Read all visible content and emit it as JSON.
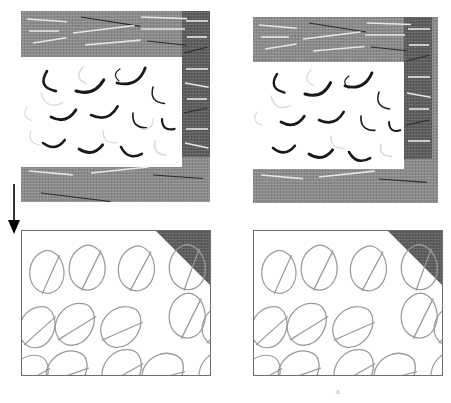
{
  "figure": {
    "title": "",
    "background_color": "#ffffff",
    "width": 451,
    "height": 403,
    "caption": "a"
  },
  "colors": {
    "matrix_light_gray": "#8c8c8c",
    "matrix_dark_gray": "#5e5e5e",
    "core_white": "#ffffff",
    "fiber_dark": "#1a1a1a",
    "fiber_light": "#d9d9d9",
    "leaf_stroke": "#9a9a9a",
    "frame_stroke": "#6e6e6e",
    "arrow_color": "#000000"
  },
  "panels": [
    {
      "id": "top-left",
      "name": "top-left-microstructure",
      "x": 21,
      "y": 11,
      "w": 189,
      "h": 191,
      "core": {
        "x": 0,
        "y": 46,
        "w": 161,
        "h": 110
      },
      "dark_strip": {
        "x": 161,
        "y": 0,
        "w": 28,
        "h": 146
      },
      "label": ""
    },
    {
      "id": "top-right",
      "name": "top-right-microstructure",
      "x": 253,
      "y": 17,
      "w": 185,
      "h": 186,
      "core": {
        "x": 0,
        "y": 45,
        "w": 151,
        "h": 107
      },
      "dark_strip": {
        "x": 151,
        "y": 0,
        "w": 28,
        "h": 142
      },
      "label": ""
    },
    {
      "id": "bottom-left",
      "name": "bottom-left-leaf-pattern",
      "x": 21,
      "y": 230,
      "w": 190,
      "h": 146,
      "corner_triangle": {
        "size": 52
      },
      "label": ""
    },
    {
      "id": "bottom-right",
      "name": "bottom-right-leaf-pattern",
      "x": 253,
      "y": 230,
      "w": 190,
      "h": 146,
      "corner_triangle": {
        "size": 52
      },
      "label": ""
    }
  ],
  "arrow": {
    "name": "transition-arrow-down",
    "x": 5,
    "y": 186,
    "length": 44,
    "direction": "down"
  },
  "chart_data": {
    "type": "scatter",
    "title": "",
    "xlabel": "",
    "ylabel": "",
    "series": [
      {
        "name": "fibers-top-left",
        "count": 19,
        "values": [
          {
            "x": 26,
            "y": 14,
            "len": 22,
            "rot": 66,
            "bow": 16,
            "w": 2.6,
            "tone": "dark"
          },
          {
            "x": 62,
            "y": 10,
            "len": 17,
            "rot": 78,
            "bow": 12,
            "w": 1.4,
            "tone": "light"
          },
          {
            "x": 99,
            "y": 12,
            "len": 12,
            "rot": 95,
            "bow": 8,
            "w": 1.2,
            "tone": "dark"
          },
          {
            "x": 20,
            "y": 36,
            "len": 24,
            "rot": 24,
            "bow": 14,
            "w": 1.3,
            "tone": "light"
          },
          {
            "x": 55,
            "y": 34,
            "len": 30,
            "rot": -22,
            "bow": 12,
            "w": 3.0,
            "tone": "dark"
          },
          {
            "x": 96,
            "y": 26,
            "len": 32,
            "rot": -28,
            "bow": 14,
            "w": 2.8,
            "tone": "dark"
          },
          {
            "x": 132,
            "y": 30,
            "len": 20,
            "rot": 55,
            "bow": 12,
            "w": 1.5,
            "tone": "dark"
          },
          {
            "x": 6,
            "y": 50,
            "len": 14,
            "rot": 72,
            "bow": 9,
            "w": 1.2,
            "tone": "light"
          },
          {
            "x": 30,
            "y": 60,
            "len": 26,
            "rot": -16,
            "bow": 12,
            "w": 2.8,
            "tone": "dark"
          },
          {
            "x": 70,
            "y": 58,
            "len": 28,
            "rot": -18,
            "bow": 13,
            "w": 2.6,
            "tone": "dark"
          },
          {
            "x": 112,
            "y": 56,
            "len": 20,
            "rot": 48,
            "bow": 11,
            "w": 1.6,
            "tone": "dark"
          },
          {
            "x": 141,
            "y": 62,
            "len": 16,
            "rot": 38,
            "bow": 10,
            "w": 2.2,
            "tone": "dark"
          },
          {
            "x": 22,
            "y": 86,
            "len": 22,
            "rot": -8,
            "bow": 11,
            "w": 2.6,
            "tone": "dark"
          },
          {
            "x": 58,
            "y": 92,
            "len": 24,
            "rot": -10,
            "bow": 11,
            "w": 2.8,
            "tone": "dark"
          },
          {
            "x": 100,
            "y": 90,
            "len": 22,
            "rot": 18,
            "bow": 11,
            "w": 2.6,
            "tone": "dark"
          },
          {
            "x": 134,
            "y": 84,
            "len": 18,
            "rot": 52,
            "bow": 10,
            "w": 1.6,
            "tone": "light"
          },
          {
            "x": 10,
            "y": 74,
            "len": 16,
            "rot": 60,
            "bow": 9,
            "w": 1.2,
            "tone": "light"
          },
          {
            "x": 82,
            "y": 74,
            "len": 18,
            "rot": 40,
            "bow": 10,
            "w": 1.3,
            "tone": "light"
          },
          {
            "x": 120,
            "y": 72,
            "len": 16,
            "rot": -40,
            "bow": 9,
            "w": 1.4,
            "tone": "light"
          }
        ]
      },
      {
        "name": "fibers-top-right",
        "count": 17,
        "values": [
          {
            "x": 24,
            "y": 12,
            "len": 20,
            "rot": 68,
            "bow": 14,
            "w": 2.4,
            "tone": "dark"
          },
          {
            "x": 58,
            "y": 8,
            "len": 16,
            "rot": 80,
            "bow": 11,
            "w": 1.3,
            "tone": "light"
          },
          {
            "x": 96,
            "y": 14,
            "len": 12,
            "rot": 92,
            "bow": 8,
            "w": 1.2,
            "tone": "dark"
          },
          {
            "x": 18,
            "y": 34,
            "len": 22,
            "rot": 26,
            "bow": 13,
            "w": 1.3,
            "tone": "light"
          },
          {
            "x": 52,
            "y": 32,
            "len": 28,
            "rot": -24,
            "bow": 12,
            "w": 3.0,
            "tone": "dark"
          },
          {
            "x": 92,
            "y": 24,
            "len": 30,
            "rot": -26,
            "bow": 13,
            "w": 2.8,
            "tone": "dark"
          },
          {
            "x": 126,
            "y": 30,
            "len": 20,
            "rot": 58,
            "bow": 12,
            "w": 1.5,
            "tone": "dark"
          },
          {
            "x": 4,
            "y": 50,
            "len": 14,
            "rot": 70,
            "bow": 9,
            "w": 1.2,
            "tone": "light"
          },
          {
            "x": 28,
            "y": 60,
            "len": 24,
            "rot": -14,
            "bow": 11,
            "w": 2.8,
            "tone": "dark"
          },
          {
            "x": 66,
            "y": 58,
            "len": 26,
            "rot": -18,
            "bow": 12,
            "w": 2.6,
            "tone": "dark"
          },
          {
            "x": 108,
            "y": 54,
            "len": 20,
            "rot": 46,
            "bow": 11,
            "w": 1.6,
            "tone": "dark"
          },
          {
            "x": 136,
            "y": 60,
            "len": 14,
            "rot": 36,
            "bow": 9,
            "w": 2.0,
            "tone": "dark"
          },
          {
            "x": 20,
            "y": 86,
            "len": 22,
            "rot": -6,
            "bow": 11,
            "w": 2.6,
            "tone": "dark"
          },
          {
            "x": 56,
            "y": 92,
            "len": 24,
            "rot": -10,
            "bow": 11,
            "w": 2.8,
            "tone": "dark"
          },
          {
            "x": 96,
            "y": 90,
            "len": 22,
            "rot": 16,
            "bow": 11,
            "w": 2.6,
            "tone": "dark"
          },
          {
            "x": 128,
            "y": 82,
            "len": 16,
            "rot": 50,
            "bow": 10,
            "w": 1.5,
            "tone": "light"
          },
          {
            "x": 78,
            "y": 74,
            "len": 18,
            "rot": 42,
            "bow": 10,
            "w": 1.3,
            "tone": "light"
          }
        ]
      },
      {
        "name": "leaves-bottom-left",
        "rows": 3,
        "cols": 4,
        "values": [
          {
            "x": 4,
            "y": 22,
            "s": 1.0,
            "rot": -6
          },
          {
            "x": 44,
            "y": 16,
            "s": 1.05,
            "rot": -4
          },
          {
            "x": 94,
            "y": 16,
            "s": 1.05,
            "rot": -2
          },
          {
            "x": 142,
            "y": 18,
            "s": 1.05,
            "rot": -10
          },
          {
            "x": 186,
            "y": 22,
            "s": 1.0,
            "rot": -6
          },
          {
            "x": 4,
            "y": 70,
            "s": 1.0,
            "rot": 18
          },
          {
            "x": 46,
            "y": 64,
            "s": 1.05,
            "rot": 28
          },
          {
            "x": 96,
            "y": 66,
            "s": 1.05,
            "rot": 36
          },
          {
            "x": 144,
            "y": 64,
            "s": 1.05,
            "rot": -4
          },
          {
            "x": 188,
            "y": 68,
            "s": 1.0,
            "rot": 20
          },
          {
            "x": 2,
            "y": 116,
            "s": 1.0,
            "rot": 30
          },
          {
            "x": 44,
            "y": 110,
            "s": 1.05,
            "rot": 40
          },
          {
            "x": 94,
            "y": 110,
            "s": 1.05,
            "rot": 30
          },
          {
            "x": 142,
            "y": 112,
            "s": 1.05,
            "rot": 44
          },
          {
            "x": 186,
            "y": 114,
            "s": 1.0,
            "rot": 22
          }
        ]
      },
      {
        "name": "leaves-bottom-right",
        "rows": 3,
        "cols": 4,
        "values": [
          {
            "x": 4,
            "y": 22,
            "s": 1.0,
            "rot": -6
          },
          {
            "x": 44,
            "y": 16,
            "s": 1.05,
            "rot": -4
          },
          {
            "x": 94,
            "y": 16,
            "s": 1.05,
            "rot": -2
          },
          {
            "x": 142,
            "y": 18,
            "s": 1.05,
            "rot": -10
          },
          {
            "x": 186,
            "y": 22,
            "s": 1.0,
            "rot": -6
          },
          {
            "x": 4,
            "y": 70,
            "s": 1.0,
            "rot": 18
          },
          {
            "x": 46,
            "y": 64,
            "s": 1.05,
            "rot": 28
          },
          {
            "x": 96,
            "y": 66,
            "s": 1.05,
            "rot": 36
          },
          {
            "x": 144,
            "y": 64,
            "s": 1.05,
            "rot": -4
          },
          {
            "x": 188,
            "y": 68,
            "s": 1.0,
            "rot": 20
          },
          {
            "x": 2,
            "y": 116,
            "s": 1.0,
            "rot": 30
          },
          {
            "x": 44,
            "y": 110,
            "s": 1.05,
            "rot": 40
          },
          {
            "x": 94,
            "y": 110,
            "s": 1.05,
            "rot": 30
          },
          {
            "x": 142,
            "y": 112,
            "s": 1.05,
            "rot": 44
          },
          {
            "x": 186,
            "y": 114,
            "s": 1.0,
            "rot": 22
          }
        ]
      },
      {
        "name": "matrix-streaks-top-left",
        "count": 22,
        "values": [
          {
            "x": 6,
            "y": 8,
            "len": 40,
            "rot": 4,
            "tone": "light"
          },
          {
            "x": 60,
            "y": 6,
            "len": 60,
            "rot": 9,
            "tone": "dark"
          },
          {
            "x": 120,
            "y": 6,
            "len": 46,
            "rot": 2,
            "tone": "light"
          },
          {
            "x": 8,
            "y": 20,
            "len": 30,
            "rot": 0,
            "tone": "light"
          },
          {
            "x": 52,
            "y": 22,
            "len": 62,
            "rot": -7,
            "tone": "light"
          },
          {
            "x": 120,
            "y": 18,
            "len": 44,
            "rot": 0,
            "tone": "light"
          },
          {
            "x": 12,
            "y": 32,
            "len": 34,
            "rot": -9,
            "tone": "light"
          },
          {
            "x": 64,
            "y": 34,
            "len": 56,
            "rot": -5,
            "tone": "light"
          },
          {
            "x": 126,
            "y": 30,
            "len": 40,
            "rot": 6,
            "tone": "dark"
          },
          {
            "x": 165,
            "y": 10,
            "len": 22,
            "rot": 0,
            "tone": "light"
          },
          {
            "x": 166,
            "y": 26,
            "len": 20,
            "rot": 0,
            "tone": "light"
          },
          {
            "x": 163,
            "y": 42,
            "len": 24,
            "rot": -14,
            "tone": "dark"
          },
          {
            "x": 165,
            "y": 58,
            "len": 22,
            "rot": 0,
            "tone": "light"
          },
          {
            "x": 164,
            "y": 72,
            "len": 24,
            "rot": 10,
            "tone": "light"
          },
          {
            "x": 166,
            "y": 88,
            "len": 20,
            "rot": 0,
            "tone": "light"
          },
          {
            "x": 163,
            "y": 102,
            "len": 24,
            "rot": -12,
            "tone": "dark"
          },
          {
            "x": 165,
            "y": 118,
            "len": 22,
            "rot": 0,
            "tone": "light"
          },
          {
            "x": 164,
            "y": 132,
            "len": 24,
            "rot": 12,
            "tone": "light"
          },
          {
            "x": 8,
            "y": 160,
            "len": 44,
            "rot": 5,
            "tone": "light"
          },
          {
            "x": 70,
            "y": 162,
            "len": 58,
            "rot": -6,
            "tone": "light"
          },
          {
            "x": 132,
            "y": 164,
            "len": 50,
            "rot": 4,
            "tone": "dark"
          },
          {
            "x": 20,
            "y": 182,
            "len": 70,
            "rot": 7,
            "tone": "dark"
          }
        ]
      },
      {
        "name": "matrix-streaks-top-right",
        "count": 20,
        "values": [
          {
            "x": 6,
            "y": 8,
            "len": 38,
            "rot": 5,
            "tone": "light"
          },
          {
            "x": 56,
            "y": 6,
            "len": 58,
            "rot": 9,
            "tone": "dark"
          },
          {
            "x": 114,
            "y": 6,
            "len": 44,
            "rot": 2,
            "tone": "light"
          },
          {
            "x": 8,
            "y": 20,
            "len": 28,
            "rot": 0,
            "tone": "light"
          },
          {
            "x": 50,
            "y": 22,
            "len": 58,
            "rot": -7,
            "tone": "light"
          },
          {
            "x": 112,
            "y": 18,
            "len": 40,
            "rot": 0,
            "tone": "light"
          },
          {
            "x": 12,
            "y": 32,
            "len": 32,
            "rot": -9,
            "tone": "light"
          },
          {
            "x": 60,
            "y": 34,
            "len": 52,
            "rot": -5,
            "tone": "light"
          },
          {
            "x": 118,
            "y": 30,
            "len": 36,
            "rot": 6,
            "tone": "dark"
          },
          {
            "x": 155,
            "y": 12,
            "len": 22,
            "rot": 0,
            "tone": "light"
          },
          {
            "x": 156,
            "y": 28,
            "len": 20,
            "rot": 0,
            "tone": "light"
          },
          {
            "x": 153,
            "y": 44,
            "len": 24,
            "rot": -14,
            "tone": "dark"
          },
          {
            "x": 155,
            "y": 60,
            "len": 22,
            "rot": 0,
            "tone": "light"
          },
          {
            "x": 154,
            "y": 76,
            "len": 24,
            "rot": 10,
            "tone": "light"
          },
          {
            "x": 156,
            "y": 92,
            "len": 20,
            "rot": 0,
            "tone": "light"
          },
          {
            "x": 153,
            "y": 108,
            "len": 24,
            "rot": -12,
            "tone": "dark"
          },
          {
            "x": 155,
            "y": 124,
            "len": 22,
            "rot": 0,
            "tone": "light"
          },
          {
            "x": 8,
            "y": 158,
            "len": 42,
            "rot": 5,
            "tone": "light"
          },
          {
            "x": 66,
            "y": 160,
            "len": 56,
            "rot": -6,
            "tone": "light"
          },
          {
            "x": 126,
            "y": 162,
            "len": 48,
            "rot": 4,
            "tone": "dark"
          }
        ]
      }
    ]
  }
}
